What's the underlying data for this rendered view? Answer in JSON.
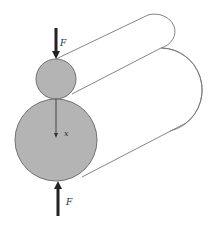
{
  "diagram": {
    "labels": {
      "force_top": "F",
      "force_bottom": "F",
      "depth_axis": "x"
    },
    "colors": {
      "cylinder_fill": "#b4b4b4",
      "outline": "#555555",
      "arrow": "#222222",
      "background": "#ffffff"
    }
  }
}
